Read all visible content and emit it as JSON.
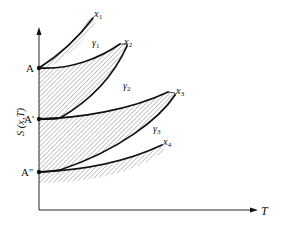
{
  "diagram": {
    "axes": {
      "y_label": "S (x,T)",
      "x_label": "T"
    },
    "points": [
      {
        "id": "A",
        "label": "A"
      },
      {
        "id": "A1",
        "label": "A'"
      },
      {
        "id": "A2",
        "label": "A''"
      }
    ],
    "curve_labels": [
      {
        "id": "x1",
        "label": "x",
        "sub": "1"
      },
      {
        "id": "x2",
        "label": "x",
        "sub": "2"
      },
      {
        "id": "x3",
        "label": "x",
        "sub": "3"
      },
      {
        "id": "x4",
        "label": "x",
        "sub": "4"
      }
    ],
    "region_labels": [
      {
        "id": "g1",
        "label": "γ",
        "sub": "1"
      },
      {
        "id": "g2",
        "label": "γ",
        "sub": "2"
      },
      {
        "id": "g3",
        "label": "γ",
        "sub": "3"
      }
    ],
    "colors": {
      "line": "#111111",
      "hatch": "#555555"
    }
  }
}
